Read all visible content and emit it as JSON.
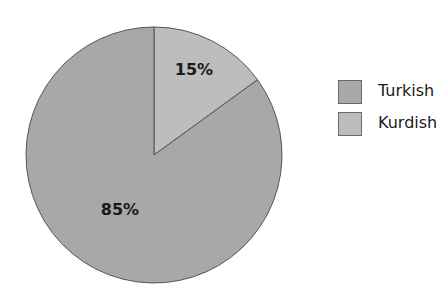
{
  "chart_data": {
    "type": "pie",
    "title": "",
    "categories": [
      "Turkish",
      "Kurdish"
    ],
    "values": [
      85,
      15
    ],
    "labels": [
      "85%",
      "15%"
    ],
    "colors": [
      "#a8a8a8",
      "#bdbdbd"
    ],
    "start_angle_deg": 0,
    "direction": "clockwise",
    "legend_position": "right"
  },
  "legend": {
    "items": [
      {
        "label": "Turkish",
        "color": "#a8a8a8"
      },
      {
        "label": "Kurdish",
        "color": "#bdbdbd"
      }
    ]
  }
}
